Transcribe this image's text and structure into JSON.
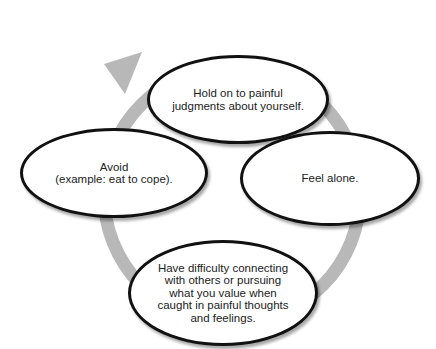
{
  "diagram": {
    "type": "cycle",
    "ring_color": "#b8b8b8",
    "nodes": [
      {
        "id": "top",
        "label": "Hold on to painful\njudgments about yourself."
      },
      {
        "id": "right",
        "label": "Feel alone."
      },
      {
        "id": "bottom",
        "label": "Have difficulty connecting\nwith others or pursuing\nwhat you value when\ncaught in painful thoughts\nand feelings."
      },
      {
        "id": "left",
        "label": "Avoid\n(example: eat to cope)."
      }
    ],
    "flow": [
      "top",
      "right",
      "bottom",
      "left",
      "top"
    ]
  }
}
